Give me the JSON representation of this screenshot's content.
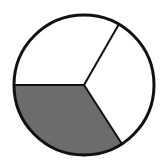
{
  "figure": {
    "title": "Circle divided into three sectors with one shaded",
    "type": "pie",
    "background_color": "#ffffff",
    "outline_color": "#111111",
    "outline_width": 3,
    "divider_color": "#111111",
    "divider_width": 2
  },
  "geometry": {
    "center_x": 84,
    "center_y": 85,
    "radius": 70,
    "units": "pixels"
  },
  "chart_data": {
    "type": "pie",
    "title": "Circle divided into three sectors with one shaded",
    "categories": [
      "upper-left white sector",
      "right white sector",
      "lower-left shaded sector"
    ],
    "values": [
      120,
      117,
      123
    ],
    "value_unit": "degrees",
    "labels": [
      "",
      "",
      ""
    ],
    "colors": [
      "#ffffff",
      "#ffffff",
      "#6c6c6c"
    ],
    "legend": "none",
    "legend_position": "none",
    "grid": false,
    "annotations": [],
    "slices": [
      {
        "name": "upper-left white sector",
        "fill": "#ffffff",
        "start_angle_deg": 180,
        "end_angle_deg": 300,
        "sweep_deg": 120,
        "shaded": false
      },
      {
        "name": "right white sector",
        "fill": "#ffffff",
        "start_angle_deg": 300,
        "end_angle_deg": 57,
        "sweep_deg": 117,
        "shaded": false
      },
      {
        "name": "lower-left shaded sector",
        "fill": "#6c6c6c",
        "start_angle_deg": 57,
        "end_angle_deg": 180,
        "sweep_deg": 123,
        "shaded": true
      }
    ],
    "dividers": [
      {
        "name": "radius-left-horizontal",
        "angle_deg": 180,
        "end_x": 14,
        "end_y": 85
      },
      {
        "name": "radius-upper-right",
        "angle_deg": 300,
        "end_x": 119,
        "end_y": 24
      },
      {
        "name": "radius-lower-right",
        "angle_deg": 57,
        "end_x": 122,
        "end_y": 144
      }
    ]
  }
}
